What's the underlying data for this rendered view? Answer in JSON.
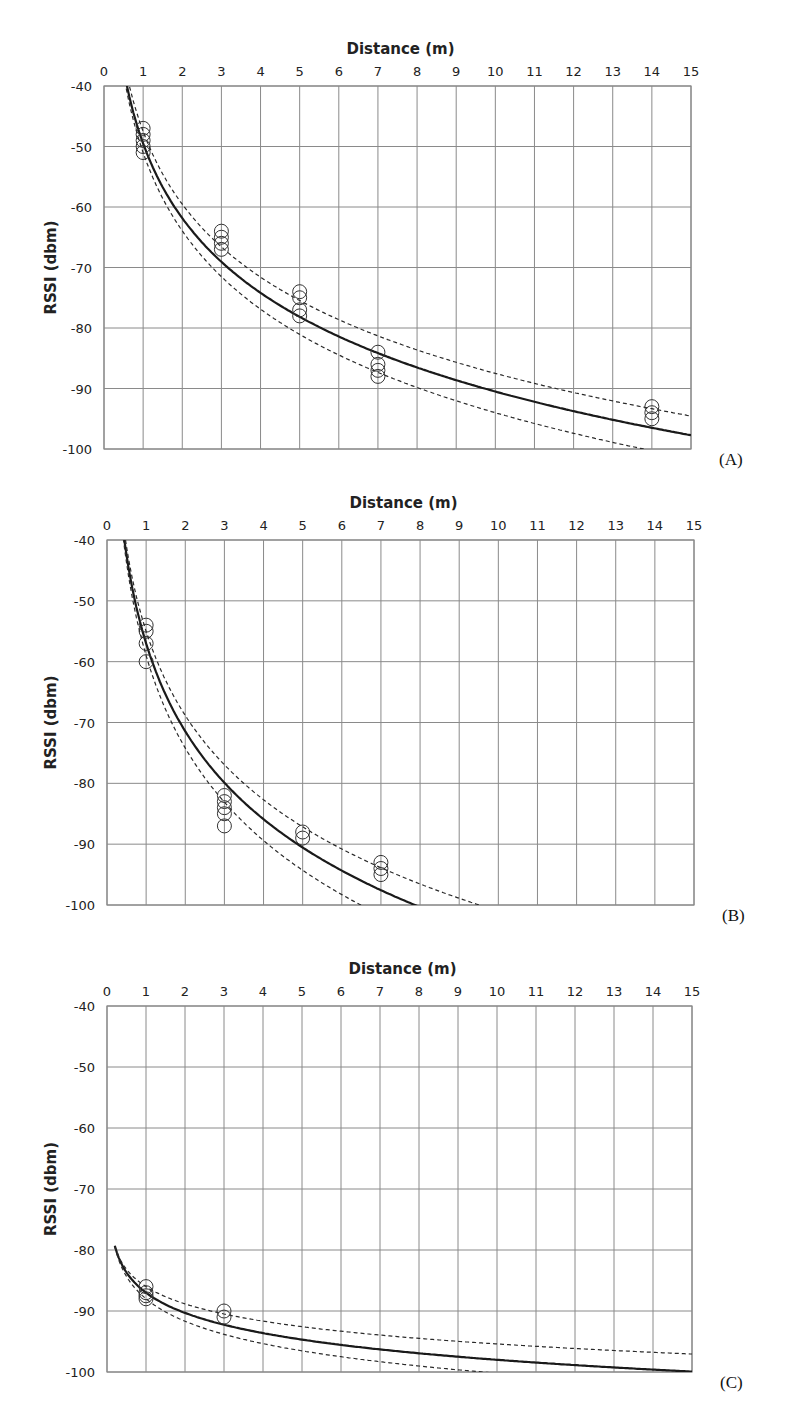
{
  "colors": {
    "grid": "#8a8a8a",
    "fit_line": "#1a1a1a",
    "bound_line": "#2a2a2a",
    "marker": "#333333"
  },
  "chart_data": [
    {
      "type": "scatter",
      "panel_label": "(A)",
      "title": "Distance (m)",
      "xlabel": "Distance (m)",
      "ylabel": "RSSI (dbm)",
      "xlim": [
        0,
        15
      ],
      "ylim": [
        -100,
        -40
      ],
      "x_ticks": [
        0,
        1,
        2,
        3,
        4,
        5,
        6,
        7,
        8,
        9,
        10,
        11,
        12,
        13,
        14,
        15
      ],
      "y_ticks": [
        -40,
        -50,
        -60,
        -70,
        -80,
        -90,
        -100
      ],
      "x_axis_position": "top",
      "grid": true,
      "points": {
        "x": [
          1,
          1,
          1,
          1,
          1,
          3,
          3,
          3,
          3,
          5,
          5,
          5,
          5,
          7,
          7,
          7,
          7,
          14,
          14,
          14
        ],
        "y": [
          -47,
          -48,
          -49,
          -50,
          -51,
          -64,
          -65,
          -66,
          -67,
          -74,
          -75,
          -77,
          -78,
          -84,
          -86,
          -87,
          -88,
          -93,
          -94,
          -95
        ]
      },
      "series": [
        {
          "name": "fit",
          "style": "solid",
          "model": "log-distance",
          "A": -49.5,
          "n": 4.1
        },
        {
          "name": "upper bound",
          "style": "dashed",
          "model": "log-distance",
          "A": -47.5,
          "n": 4.0
        },
        {
          "name": "lower bound",
          "style": "dashed",
          "model": "log-distance",
          "A": -51.0,
          "n": 4.3
        }
      ]
    },
    {
      "type": "scatter",
      "panel_label": "(B)",
      "title": "Distance (m)",
      "xlabel": "Distance (m)",
      "ylabel": "RSSI (dbm)",
      "xlim": [
        0,
        15
      ],
      "ylim": [
        -100,
        -40
      ],
      "x_ticks": [
        0,
        1,
        2,
        3,
        4,
        5,
        6,
        7,
        8,
        9,
        10,
        11,
        12,
        13,
        14,
        15
      ],
      "y_ticks": [
        -40,
        -50,
        -60,
        -70,
        -80,
        -90,
        -100
      ],
      "x_axis_position": "top",
      "grid": true,
      "points": {
        "x": [
          1,
          1,
          1,
          1,
          3,
          3,
          3,
          3,
          3,
          5,
          5,
          7,
          7,
          7
        ],
        "y": [
          -54,
          -55,
          -57,
          -60,
          -82,
          -83,
          -84,
          -85,
          -87,
          -88,
          -89,
          -93,
          -94,
          -95
        ]
      },
      "series": [
        {
          "name": "fit",
          "style": "solid",
          "model": "log-distance",
          "A": -57.0,
          "n": 4.8
        },
        {
          "name": "upper bound",
          "style": "dashed",
          "model": "log-distance",
          "A": -55.0,
          "n": 4.6
        },
        {
          "name": "lower bound",
          "style": "dashed",
          "model": "log-distance",
          "A": -59.0,
          "n": 5.05
        }
      ]
    },
    {
      "type": "scatter",
      "panel_label": "(C)",
      "title": "Distance (m)",
      "xlabel": "Distance (m)",
      "ylabel": "RSSI (dbm)",
      "xlim": [
        0,
        15
      ],
      "ylim": [
        -100,
        -40
      ],
      "x_ticks": [
        0,
        1,
        2,
        3,
        4,
        5,
        6,
        7,
        8,
        9,
        10,
        11,
        12,
        13,
        14,
        15
      ],
      "y_ticks": [
        -40,
        -50,
        -60,
        -70,
        -80,
        -90,
        -100
      ],
      "x_axis_position": "top",
      "grid": true,
      "points": {
        "x": [
          1,
          1,
          1,
          1,
          3,
          3
        ],
        "y": [
          -86,
          -87,
          -87.5,
          -88,
          -90,
          -91
        ]
      },
      "series": [
        {
          "name": "fit",
          "style": "solid",
          "model": "log-distance",
          "A": -87.0,
          "n": 1.1
        },
        {
          "name": "upper bound",
          "style": "dashed",
          "model": "log-distance",
          "A": -86.0,
          "n": 0.94
        },
        {
          "name": "lower bound",
          "style": "dashed",
          "model": "log-distance",
          "A": -88.0,
          "n": 1.22
        }
      ]
    }
  ]
}
